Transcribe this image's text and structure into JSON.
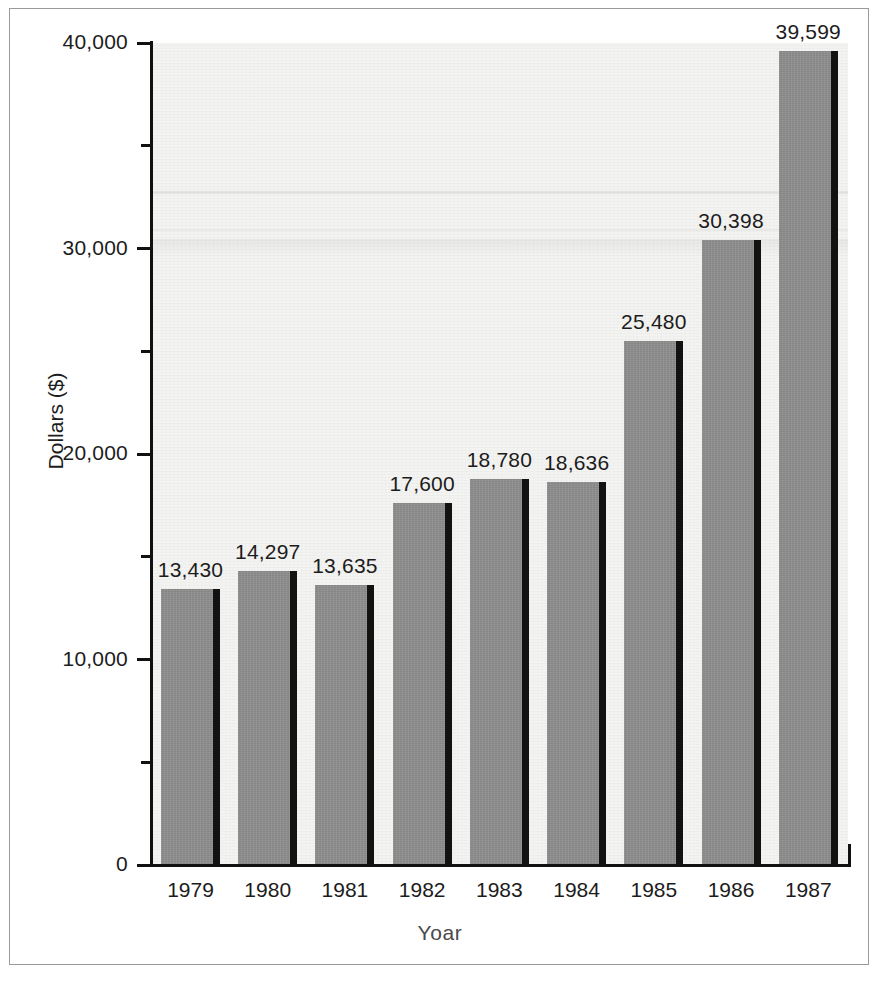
{
  "chart_data": {
    "type": "bar",
    "title": "",
    "xlabel": "Yoar",
    "ylabel": "Dollars ($)",
    "categories": [
      "1979",
      "1980",
      "1981",
      "1982",
      "1983",
      "1984",
      "1985",
      "1986",
      "1987"
    ],
    "values": [
      13430,
      14297,
      13635,
      17600,
      18780,
      18636,
      25480,
      30398,
      39599
    ],
    "value_labels": [
      "13,430",
      "14,297",
      "13,635",
      "17,600",
      "18,780",
      "18,636",
      "25,480",
      "30,398",
      "39,599"
    ],
    "ylim": [
      0,
      40000
    ],
    "y_ticks": [
      0,
      10000,
      20000,
      30000,
      40000
    ],
    "y_tick_labels": [
      "0",
      "10,000",
      "20,000",
      "30,000",
      "40,000"
    ],
    "y_minor_ticks": [
      5000,
      15000,
      25000,
      35000
    ],
    "grid": false,
    "legend": null,
    "bar_color": "#8e8e8e",
    "bar_shadow_color": "#121212",
    "plot_background": "#f3f3f1",
    "axis_color": "#111111",
    "text_color": "#1c1c1c"
  },
  "figure": {
    "frame_color": "#9a9a9a",
    "background": "#ffffff"
  }
}
